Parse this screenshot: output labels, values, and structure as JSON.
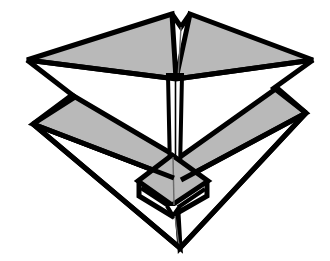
{
  "figure": {
    "title": "Folded Deployable Canopy Structure",
    "style": "black-and-white line art, technical illustration",
    "caption": "",
    "annotations": [],
    "labels": [],
    "colors": {
      "background": "#ffffff",
      "outline": "#000000",
      "facet_fill_gray": "#b9b9b9",
      "facet_fill_white": "#ffffff",
      "crease_line": "#6b6b6b"
    },
    "geometry": {
      "canvas_width": 330,
      "canvas_height": 261,
      "outline_stroke_width": 5,
      "crease_stroke_width": 1,
      "apex_top": [
        172,
        14
      ],
      "apex_bottom": [
        180,
        248
      ],
      "left_point_upper": [
        27,
        60
      ],
      "right_point_upper": [
        313,
        60
      ],
      "left_point_lower": [
        33,
        124
      ],
      "right_point_lower": [
        306,
        113
      ],
      "hub_center": [
        172,
        182
      ]
    },
    "parts": [
      {
        "name": "upper-left-wing",
        "fill": "gray"
      },
      {
        "name": "upper-right-wing",
        "fill": "gray"
      },
      {
        "name": "lower-left-wing",
        "fill": "gray"
      },
      {
        "name": "lower-right-wing",
        "fill": "gray"
      },
      {
        "name": "lower-left-skirt",
        "fill": "white"
      },
      {
        "name": "lower-right-skirt",
        "fill": "white"
      },
      {
        "name": "central-shaft",
        "fill": "white"
      },
      {
        "name": "hub-top-facet",
        "fill": "gray"
      },
      {
        "name": "hub-collar",
        "fill": "white"
      }
    ]
  }
}
